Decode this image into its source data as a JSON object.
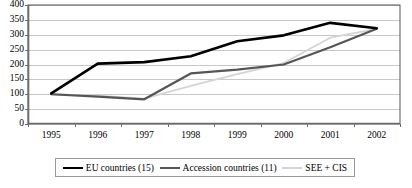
{
  "chart_data": {
    "type": "line",
    "title": "",
    "subtitle": "",
    "xlabel": "",
    "ylabel": "",
    "categories": [
      "1995",
      "1996",
      "1997",
      "1998",
      "1999",
      "2000",
      "2001",
      "2002"
    ],
    "ylim": [
      0,
      400
    ],
    "ytick_step": 50,
    "yticks": [
      "400",
      "350",
      "300",
      "250",
      "200",
      "150",
      "100",
      "50",
      "0"
    ],
    "grid": true,
    "grid_axis": "y",
    "legend_position": "bottom",
    "series": [
      {
        "name": "EU countries (15)",
        "color": "#000000",
        "values": [
          103,
          203,
          208,
          228,
          278,
          298,
          340,
          322
        ]
      },
      {
        "name": "Accession countries (11)",
        "color": "#565656",
        "values": [
          100,
          92,
          83,
          170,
          183,
          200,
          258,
          320
        ]
      },
      {
        "name": "SEE + CIS",
        "color": "#d4d4d4",
        "values": [
          100,
          95,
          85,
          128,
          168,
          205,
          290,
          320
        ]
      }
    ]
  },
  "axes": {
    "y_tick_labels": [
      "400",
      "350",
      "300",
      "250",
      "200",
      "150",
      "100",
      "50",
      "0"
    ],
    "x_tick_labels": [
      "1995",
      "1996",
      "1997",
      "1998",
      "1999",
      "2000",
      "2001",
      "2002"
    ]
  },
  "legend": {
    "entries": [
      {
        "label": "EU countries (15)",
        "swatch": "line-swatch-black"
      },
      {
        "label": "Accession countries (11)",
        "swatch": "line-swatch-gray"
      },
      {
        "label": "SEE + CIS",
        "swatch": "line-swatch-light-gray"
      }
    ]
  },
  "colors": {
    "eu": "#000000",
    "accession": "#565656",
    "see_cis": "#d4d4d4",
    "grid": "#c8c8c8",
    "axis": "#6b6b6b",
    "frame": "#555555",
    "background": "#ffffff"
  }
}
